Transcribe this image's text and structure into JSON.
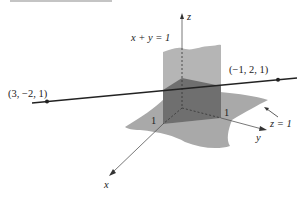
{
  "figure": {
    "labels": {
      "plane_xy": "x + y = 1",
      "plane_z": "z = 1",
      "point_a": "(3, −2, 1)",
      "point_b": "(−1, 2, 1)",
      "axis_x": "x",
      "axis_y": "y",
      "axis_z": "z",
      "tick_x": "1",
      "tick_y": "1"
    },
    "points": [
      {
        "name": "A",
        "coords": [
          3,
          -2,
          1
        ]
      },
      {
        "name": "B",
        "coords": [
          -1,
          2,
          1
        ]
      }
    ],
    "planes": [
      {
        "equation": "x + y = 1"
      },
      {
        "equation": "z = 1"
      }
    ],
    "colors": {
      "plane_light": "#a9a9a9",
      "plane_vertical": "#b5b5b5",
      "triangle_dark": "#6f6f6f",
      "line": "#222222",
      "axis": "#555555"
    }
  }
}
